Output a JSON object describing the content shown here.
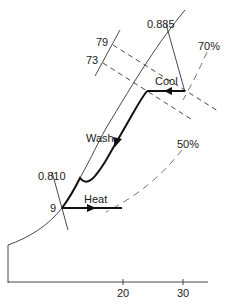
{
  "diagram": {
    "type": "psychrometric-process",
    "axis": {
      "x_ticks": [
        {
          "label": "20",
          "x": 123
        },
        {
          "label": "30",
          "x": 183
        }
      ]
    },
    "constant_volume_lines": [
      {
        "label": "0.885"
      },
      {
        "label": "0.810"
      }
    ],
    "wet_bulb_scale": {
      "ticks": [
        {
          "label": "79"
        },
        {
          "label": "73"
        }
      ]
    },
    "relative_humidity_curves": [
      {
        "label": "70%"
      },
      {
        "label": "50%"
      }
    ],
    "state_point_label": "9",
    "processes": [
      {
        "label": "Cool",
        "direction": "right-to-left"
      },
      {
        "label": "Wash",
        "direction": "down-along-saturation"
      },
      {
        "label": "Heat",
        "direction": "left-to-right"
      }
    ],
    "colors": {
      "line": "#333333",
      "process": "#111111",
      "dashed": "#666666",
      "background": "#ffffff"
    }
  }
}
